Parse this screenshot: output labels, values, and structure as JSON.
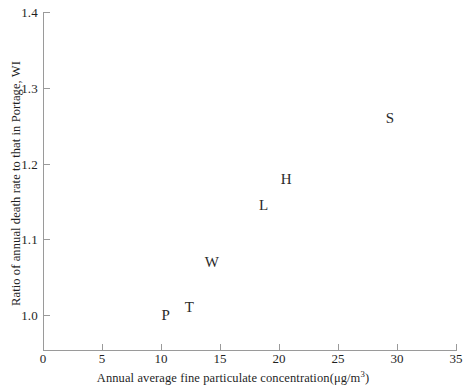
{
  "chart_data": {
    "type": "scatter",
    "title": "",
    "xlabel": "Annual average fine particulate concentration(μg/m³)",
    "ylabel": "Ratio of annual death rate to that in Portage, WI",
    "xlim": [
      0,
      35
    ],
    "ylim": [
      1.0,
      1.4
    ],
    "grid": false,
    "legend": "none",
    "marker_style": "text-label",
    "xticks": [
      "0",
      "5",
      "10",
      "15",
      "20",
      "25",
      "30",
      "35"
    ],
    "xtick_values": [
      0,
      5,
      10,
      15,
      20,
      25,
      30,
      35
    ],
    "yticks": [
      "1.0",
      "1.1",
      "1.2",
      "1.3",
      "1.4"
    ],
    "ytick_values": [
      1.0,
      1.1,
      1.2,
      1.3,
      1.4
    ],
    "points": [
      {
        "label": "P",
        "x": 10.4,
        "y": 1.0
      },
      {
        "label": "T",
        "x": 12.4,
        "y": 1.01
      },
      {
        "label": "W",
        "x": 14.3,
        "y": 1.07
      },
      {
        "label": "L",
        "x": 18.7,
        "y": 1.145
      },
      {
        "label": "H",
        "x": 20.6,
        "y": 1.18
      },
      {
        "label": "S",
        "x": 29.4,
        "y": 1.26
      }
    ]
  },
  "axis_title_x_plain": "Annual average fine particulate concentration(μg/m",
  "axis_title_x_sup": "3",
  "axis_title_x_tail": ")",
  "colors": {
    "axis": "#9a9a9a",
    "text": "#1f1f1f",
    "marker_text": "#2a2a2a",
    "background": "#ffffff"
  }
}
